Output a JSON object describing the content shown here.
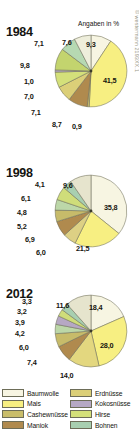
{
  "units_note": "Angaben in %",
  "watermark": "© westermann 2193XX.1",
  "colors": {
    "baumwolle": "#f7f5e2",
    "mais": "#f7ef82",
    "cashewnuesse": "#c9bd6a",
    "maniok": "#b08a4e",
    "erdnuesse": "#dbcf78",
    "kokosnuesse": "#b6a8c4",
    "hirse": "#d4e07a",
    "bohnen": "#a8cfb0",
    "outline": "#6d6d58",
    "text": "#15150f"
  },
  "legend": [
    {
      "label": "Baumwolle",
      "color": "#f7f5e2"
    },
    {
      "label": "Erdnüsse",
      "color": "#dbcf78"
    },
    {
      "label": "Mais",
      "color": "#f7ef82"
    },
    {
      "label": "Kokosnüsse",
      "color": "#b6a8c4"
    },
    {
      "label": "Cashewnüsse",
      "color": "#c9bd6a"
    },
    {
      "label": "Hirse",
      "color": "#d4e07a"
    },
    {
      "label": "Maniok",
      "color": "#b08a4e"
    },
    {
      "label": "Bohnen",
      "color": "#a8cfb0"
    }
  ],
  "charts": [
    {
      "year": "1984",
      "labels": [
        "9,3",
        "41,5",
        "0,9",
        "8,7",
        "7,1",
        "7,0",
        "1,0",
        "9,8",
        "7,1",
        "7,6"
      ]
    },
    {
      "year": "1998",
      "labels": [
        "9,6",
        "35,8",
        "21,5",
        "6,0",
        "6,9",
        "5,2",
        "4,8",
        "6,1",
        "4,1"
      ]
    },
    {
      "year": "2012",
      "labels": [
        "18,4",
        "28,0",
        "14,0",
        "7,4",
        "6,0",
        "4,2",
        "3,9",
        "3,2",
        "3,3",
        "11,6"
      ]
    }
  ],
  "chart_data": {
    "type": "pie",
    "title": "",
    "unit": "%",
    "legend_position": "bottom",
    "series": [
      {
        "name": "1984",
        "slices": [
          {
            "label": "Baumwolle",
            "value": 9.3,
            "color": "#f7f5e2"
          },
          {
            "label": "Mais",
            "value": 41.5,
            "color": "#f7ef82"
          },
          {
            "label": "Cashewnüsse",
            "value": 0.9,
            "color": "#c9bd6a"
          },
          {
            "label": "Maniok",
            "value": 8.7,
            "color": "#b08a4e"
          },
          {
            "label": "Erdnüsse",
            "value": 7.1,
            "color": "#dbcf78"
          },
          {
            "label": "Hirse",
            "value": 7.0,
            "color": "#d4e07a"
          },
          {
            "label": "Kokosnüsse",
            "value": 1.0,
            "color": "#b6a8c4"
          },
          {
            "label": "Bohnen",
            "value": 9.8,
            "color": "#c3d46e"
          },
          {
            "label": "Sonstige 1",
            "value": 7.1,
            "color": "#b6d9b2"
          },
          {
            "label": "Sonstige 2",
            "value": 7.6,
            "color": "#eeeedb"
          }
        ]
      },
      {
        "name": "1998",
        "slices": [
          {
            "label": "Baumwolle",
            "value": 35.8,
            "color": "#f7f5e2"
          },
          {
            "label": "Mais",
            "value": 21.5,
            "color": "#f7ef82"
          },
          {
            "label": "Cashewnüsse",
            "value": 6.0,
            "color": "#ddd084"
          },
          {
            "label": "Maniok",
            "value": 6.9,
            "color": "#b08a4e"
          },
          {
            "label": "Erdnüsse",
            "value": 5.2,
            "color": "#c7bb6a"
          },
          {
            "label": "Kokosnüsse",
            "value": 4.8,
            "color": "#bcd7a8"
          },
          {
            "label": "Hirse",
            "value": 6.1,
            "color": "#cfdd7a"
          },
          {
            "label": "Bohnen",
            "value": 4.1,
            "color": "#a8cfb0"
          },
          {
            "label": "Sonstige",
            "value": 9.6,
            "color": "#e6e4cd"
          }
        ]
      },
      {
        "name": "2012",
        "slices": [
          {
            "label": "Baumwolle",
            "value": 18.4,
            "color": "#f7f5e2"
          },
          {
            "label": "Mais",
            "value": 28.0,
            "color": "#f7ef82"
          },
          {
            "label": "Cashewnüsse",
            "value": 14.0,
            "color": "#e3d77f"
          },
          {
            "label": "Maniok",
            "value": 7.4,
            "color": "#b08a4e"
          },
          {
            "label": "Erdnüsse",
            "value": 6.0,
            "color": "#c7bb6a"
          },
          {
            "label": "Hirse",
            "value": 4.2,
            "color": "#bcd7a8"
          },
          {
            "label": "Kokosnüsse",
            "value": 3.9,
            "color": "#b6a8c4"
          },
          {
            "label": "Bohnen",
            "value": 3.2,
            "color": "#cfdd7a"
          },
          {
            "label": "Sonstige 1",
            "value": 3.3,
            "color": "#a8cfb0"
          },
          {
            "label": "Sonstige 2",
            "value": 11.6,
            "color": "#e6e4cd"
          }
        ]
      }
    ]
  }
}
